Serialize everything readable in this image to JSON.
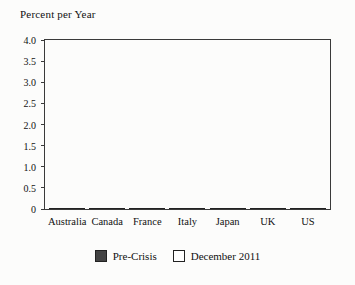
{
  "title": "Percent per Year",
  "chart_data": {
    "type": "bar",
    "title": "Percent per Year",
    "categories": [
      "Australia",
      "Canada",
      "France",
      "Italy",
      "Japan",
      "UK",
      "US"
    ],
    "series": [
      {
        "name": "Pre-Crisis",
        "fill": "#434343",
        "values": [
          3.45,
          2.45,
          2.35,
          2.35,
          1.5,
          3.55,
          2.6
        ]
      },
      {
        "name": "December 2011",
        "fill": "#ffffff",
        "values": [
          2.65,
          1.75,
          2.05,
          0.85,
          0.35,
          2.6,
          2.0
        ]
      }
    ],
    "xlabel": "",
    "ylabel": "Percent per Year",
    "ylim": [
      0,
      4.0
    ],
    "yticks": [
      "4.0",
      "3.5",
      "3.0",
      "2.5",
      "2.0",
      "1.5",
      "1.0",
      "0.5",
      "0"
    ],
    "grid": false,
    "legend_position": "bottom-center"
  },
  "colors": {
    "bar_dark": "#434343",
    "bar_light": "#ffffff",
    "frame": "#3a3a3a",
    "background": "#fcfcfb",
    "text": "#111111"
  }
}
